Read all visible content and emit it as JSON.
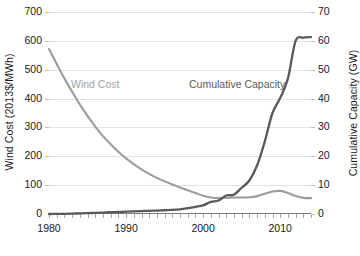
{
  "chart_data": {
    "type": "line",
    "title": "",
    "xlabel": "",
    "grid": true,
    "legend_position": "inline-annotations",
    "x_axis": {
      "min": 1980,
      "max": 2014,
      "ticks": [
        1980,
        1990,
        2000,
        2010
      ],
      "tick_labels": [
        "1980",
        "1990",
        "2000",
        "2010"
      ],
      "minor_tick_interval": 1
    },
    "y_axis_left": {
      "label": "Wind Cost (2013$/MWh)",
      "min": 0,
      "max": 700,
      "ticks": [
        0,
        100,
        200,
        300,
        400,
        500,
        600,
        700
      ],
      "tick_labels": [
        "0",
        "100",
        "200",
        "300",
        "400",
        "500",
        "600",
        "700"
      ]
    },
    "y_axis_right": {
      "label": "Cumulative Capacity (GW)",
      "min": 0,
      "max": 70,
      "ticks": [
        0,
        10,
        20,
        30,
        40,
        50,
        60,
        70
      ],
      "tick_labels": [
        "0",
        "10",
        "20",
        "30",
        "40",
        "50",
        "60",
        "70"
      ]
    },
    "series": [
      {
        "name": "Wind Cost",
        "axis": "left",
        "color": "#9c9c9c",
        "unit": "2013$/MWh",
        "annotation": "Wind Cost",
        "x": [
          1980,
          1981,
          1982,
          1983,
          1984,
          1985,
          1986,
          1987,
          1988,
          1989,
          1990,
          1991,
          1992,
          1993,
          1994,
          1995,
          1996,
          1997,
          1998,
          1999,
          2000,
          2001,
          2002,
          2003,
          2004,
          2005,
          2006,
          2007,
          2008,
          2009,
          2010,
          2011,
          2012,
          2013,
          2014
        ],
        "values": [
          572,
          520,
          470,
          424,
          380,
          340,
          303,
          270,
          242,
          216,
          193,
          173,
          155,
          139,
          125,
          113,
          102,
          92,
          82,
          73,
          63,
          57,
          55,
          56,
          57,
          57,
          58,
          62,
          70,
          78,
          80,
          73,
          62,
          56,
          55
        ]
      },
      {
        "name": "Cumulative Capacity",
        "axis": "right",
        "color": "#595959",
        "unit": "GW",
        "annotation": "Cumulative Capacity",
        "x": [
          1980,
          1981,
          1982,
          1983,
          1984,
          1985,
          1986,
          1987,
          1988,
          1989,
          1990,
          1991,
          1992,
          1993,
          1994,
          1995,
          1996,
          1997,
          1998,
          1999,
          2000,
          2001,
          2002,
          2003,
          2004,
          2005,
          2006,
          2007,
          2008,
          2009,
          2010,
          2011,
          2012,
          2013,
          2014
        ],
        "values": [
          0.0,
          0.02,
          0.05,
          0.1,
          0.2,
          0.3,
          0.4,
          0.5,
          0.6,
          0.7,
          0.8,
          0.9,
          1.0,
          1.1,
          1.2,
          1.3,
          1.4,
          1.6,
          2.0,
          2.5,
          3.0,
          4.2,
          4.7,
          6.4,
          6.7,
          9.1,
          11.6,
          16.8,
          25.1,
          35.0,
          40.2,
          46.9,
          60.0,
          61.1,
          61.3
        ]
      }
    ]
  }
}
